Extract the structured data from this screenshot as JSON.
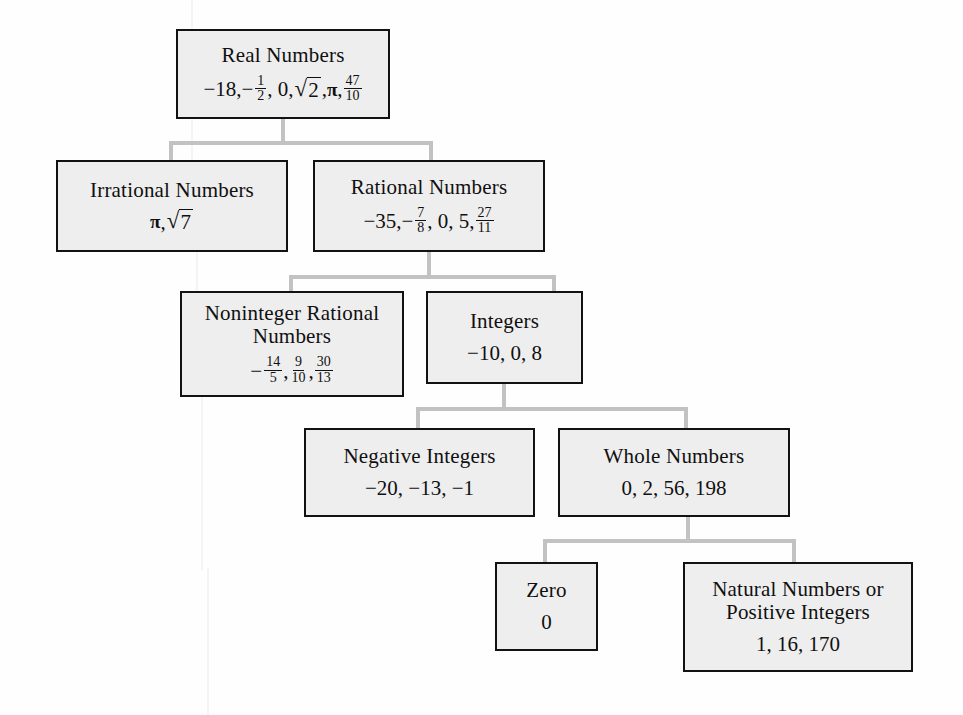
{
  "diagram": {
    "box_fill": "#eeeeee",
    "box_border": "#121212",
    "connector_color": "#c2c2c2",
    "nodes": {
      "real": {
        "title": "Real Numbers",
        "examples_text": "−18, − 1/2, 0, √2, π, 47/10",
        "parts": {
          "a": "−18, ",
          "neg": "−",
          "frac1_num": "1",
          "frac1_den": "2",
          "b": ", 0, ",
          "radicand": "2",
          "c": ", ",
          "pi": "π",
          "d": ", ",
          "frac2_num": "47",
          "frac2_den": "10"
        }
      },
      "irrational": {
        "title": "Irrational Numbers",
        "examples_text": "π, √7",
        "parts": {
          "pi": "π",
          "sep": ", ",
          "radicand": "7"
        }
      },
      "rational": {
        "title": "Rational Numbers",
        "examples_text": "−35, − 7/8, 0, 5, 27/11",
        "parts": {
          "a": "−35, ",
          "neg": "−",
          "frac1_num": "7",
          "frac1_den": "8",
          "b": ", 0, 5, ",
          "frac2_num": "27",
          "frac2_den": "11"
        }
      },
      "noninteger": {
        "title_line1": "Noninteger Rational",
        "title_line2": "Numbers",
        "examples_text": "− 14/5, 9/10, 30/13",
        "parts": {
          "neg": "−",
          "frac1_num": "14",
          "frac1_den": "5",
          "sep1": ", ",
          "frac2_num": "9",
          "frac2_den": "10",
          "sep2": ", ",
          "frac3_num": "30",
          "frac3_den": "13"
        }
      },
      "integers": {
        "title": "Integers",
        "examples_text": "−10, 0, 8"
      },
      "negative_integers": {
        "title": "Negative Integers",
        "examples_text": "−20, −13, −1"
      },
      "whole": {
        "title": "Whole Numbers",
        "examples_text": "0, 2, 56, 198"
      },
      "zero": {
        "title": "Zero",
        "examples_text": "0"
      },
      "natural": {
        "title_line1": "Natural Numbers or",
        "title_line2": "Positive Integers",
        "examples_text": "1, 16, 170"
      }
    },
    "edges": [
      {
        "from": "real",
        "to": "irrational"
      },
      {
        "from": "real",
        "to": "rational"
      },
      {
        "from": "rational",
        "to": "noninteger"
      },
      {
        "from": "rational",
        "to": "integers"
      },
      {
        "from": "integers",
        "to": "negative_integers"
      },
      {
        "from": "integers",
        "to": "whole"
      },
      {
        "from": "whole",
        "to": "zero"
      },
      {
        "from": "whole",
        "to": "natural"
      }
    ]
  }
}
